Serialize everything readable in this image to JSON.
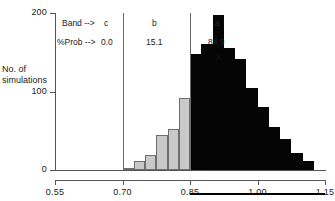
{
  "axes": {
    "y_label_line1": "No. of",
    "y_label_line2": "simulations",
    "y_ticks": [
      "0",
      "100",
      "200"
    ],
    "x_ticks": [
      "0.55",
      "0.70",
      "0.85",
      "1.00",
      "1.15"
    ]
  },
  "annotations": {
    "band_label": "Band -->",
    "prob_label": "%Prob -->",
    "band_c": "c",
    "band_b": "b",
    "band_a": "a",
    "prob_c": "0.0",
    "prob_b": "15.1",
    "prob_a": "84.9",
    "marker": "X"
  },
  "colors": {
    "gray_bar": "#c9c9c9",
    "gray_bar_edge": "#6e6e6e",
    "black_bar": "#050505",
    "axis": "#555555",
    "divider": "#6a6a6a",
    "footer_bar": "#000000"
  },
  "chart_data": {
    "type": "bar",
    "title": "",
    "xlabel": "",
    "ylabel": "No. of simulations",
    "xlim": [
      0.55,
      1.15
    ],
    "ylim": [
      0,
      200
    ],
    "grid": false,
    "legend": "none",
    "bin_width": 0.025,
    "band_dividers": [
      0.7,
      0.85
    ],
    "bands": [
      {
        "name": "c",
        "prob_percent": 0.0,
        "range": [
          0.55,
          0.7
        ],
        "color": "#c9c9c9"
      },
      {
        "name": "b",
        "prob_percent": 15.1,
        "range": [
          0.7,
          0.85
        ],
        "color": "#c9c9c9"
      },
      {
        "name": "a",
        "prob_percent": 84.9,
        "range": [
          0.85,
          1.15
        ],
        "color": "#050505"
      }
    ],
    "marker_x_value": 0.925,
    "footer_bar_range": [
      0.85,
      1.15
    ],
    "bins": [
      {
        "x0": 0.7,
        "x1": 0.725,
        "value": 3,
        "color": "gray"
      },
      {
        "x0": 0.725,
        "x1": 0.75,
        "value": 11,
        "color": "gray"
      },
      {
        "x0": 0.75,
        "x1": 0.775,
        "value": 19,
        "color": "gray"
      },
      {
        "x0": 0.775,
        "x1": 0.8,
        "value": 44,
        "color": "gray"
      },
      {
        "x0": 0.8,
        "x1": 0.825,
        "value": 52,
        "color": "gray"
      },
      {
        "x0": 0.825,
        "x1": 0.85,
        "value": 92,
        "color": "gray"
      },
      {
        "x0": 0.85,
        "x1": 0.875,
        "value": 148,
        "color": "black"
      },
      {
        "x0": 0.875,
        "x1": 0.9,
        "value": 160,
        "color": "black"
      },
      {
        "x0": 0.9,
        "x1": 0.925,
        "value": 197,
        "color": "black"
      },
      {
        "x0": 0.925,
        "x1": 0.95,
        "value": 155,
        "color": "black"
      },
      {
        "x0": 0.95,
        "x1": 0.975,
        "value": 141,
        "color": "black"
      },
      {
        "x0": 0.975,
        "x1": 1.0,
        "value": 104,
        "color": "black"
      },
      {
        "x0": 1.0,
        "x1": 1.025,
        "value": 80,
        "color": "black"
      },
      {
        "x0": 1.025,
        "x1": 1.05,
        "value": 55,
        "color": "black"
      },
      {
        "x0": 1.05,
        "x1": 1.075,
        "value": 40,
        "color": "black"
      },
      {
        "x0": 1.075,
        "x1": 1.1,
        "value": 22,
        "color": "black"
      },
      {
        "x0": 1.1,
        "x1": 1.125,
        "value": 11,
        "color": "black"
      }
    ]
  }
}
